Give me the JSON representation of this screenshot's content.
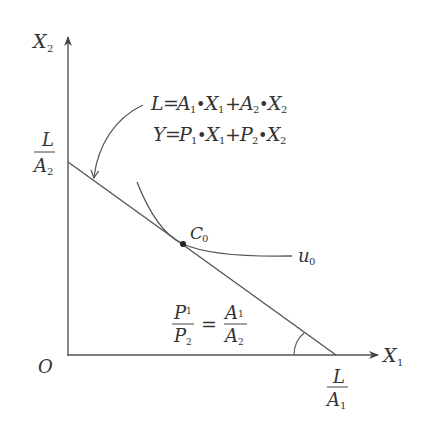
{
  "diagram": {
    "type": "economics-budget-constraint",
    "axes": {
      "y_label": "X",
      "y_label_sub": "2",
      "x_label": "X",
      "x_label_sub": "1",
      "origin_label": "O"
    },
    "intercepts": {
      "y_intercept": {
        "numerator": "L",
        "denominator": "A",
        "denominator_sub": "2"
      },
      "x_intercept": {
        "numerator": "L",
        "denominator": "A",
        "denominator_sub": "1"
      }
    },
    "equations": {
      "labor_constraint": "L = A₁•X₁ + A₂•X₂",
      "income": "Y = P₁•X₁ + P₂•X₂"
    },
    "tangency_point": {
      "label": "C",
      "sub": "0"
    },
    "indifference_curve": {
      "label": "u",
      "sub": "0"
    },
    "slope_relation": {
      "left_num": "P",
      "left_num_sub": "1",
      "left_den": "P",
      "left_den_sub": "2",
      "equals": "=",
      "right_num": "A",
      "right_num_sub": "1",
      "right_den": "A",
      "right_den_sub": "2"
    },
    "colors": {
      "line": "#555555",
      "text": "#333333",
      "background": "#ffffff"
    }
  }
}
